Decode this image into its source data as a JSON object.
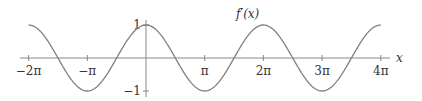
{
  "chart_data": {
    "type": "line",
    "title": "",
    "function_label": "f′(x)",
    "xlabel": "x",
    "ylabel": "",
    "x_range": [
      -6.2832,
      12.5664
    ],
    "ylim": [
      -1,
      1
    ],
    "grid": false,
    "legend": "none",
    "x_ticks": [
      {
        "value": -6.2832,
        "label": "−2π"
      },
      {
        "value": -3.1416,
        "label": "−π"
      },
      {
        "value": 3.1416,
        "label": "π"
      },
      {
        "value": 6.2832,
        "label": "2π"
      },
      {
        "value": 9.4248,
        "label": "3π"
      },
      {
        "value": 12.5664,
        "label": "4π"
      }
    ],
    "y_ticks": [
      {
        "value": 1,
        "label": "1"
      },
      {
        "value": -1,
        "label": "−1"
      }
    ],
    "series": [
      {
        "name": "f′(x)",
        "expression": "cos(x)",
        "x": [
          -6.2832,
          -4.7124,
          -3.1416,
          -1.5708,
          0,
          1.5708,
          3.1416,
          4.7124,
          6.2832,
          7.854,
          9.4248,
          10.9956,
          12.5664
        ],
        "values": [
          1,
          0,
          -1,
          0,
          1,
          0,
          -1,
          0,
          1,
          0,
          -1,
          0,
          1
        ]
      }
    ],
    "colors": {
      "curve": "#808080",
      "axis": "#808080",
      "text": "#333333"
    }
  }
}
